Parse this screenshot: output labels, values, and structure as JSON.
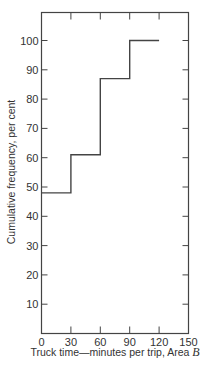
{
  "chart_data": {
    "type": "line",
    "subtype": "step",
    "title": "",
    "xlabel": "Truck time—minutes per trip, Area B",
    "xlabel_main": "Truck time—minutes per trip, Area ",
    "xlabel_italic": "B",
    "ylabel": "Cumulative frequency, per cent",
    "xlim": [
      0,
      150
    ],
    "ylim": [
      0,
      110
    ],
    "x_ticks": [
      0,
      30,
      60,
      90,
      120,
      150
    ],
    "y_ticks": [
      10,
      20,
      30,
      40,
      50,
      60,
      70,
      80,
      90,
      100
    ],
    "grid": false,
    "legend": null,
    "series": [
      {
        "name": "Cumulative frequency",
        "x": [
          0,
          30,
          30,
          60,
          60,
          90,
          90,
          120
        ],
        "y": [
          48,
          48,
          61,
          61,
          87,
          87,
          100,
          100
        ]
      }
    ],
    "steps": [
      {
        "x_from": 0,
        "x_to": 30,
        "value": 48
      },
      {
        "x_from": 30,
        "x_to": 60,
        "value": 61
      },
      {
        "x_from": 60,
        "x_to": 90,
        "value": 87
      },
      {
        "x_from": 90,
        "x_to": 120,
        "value": 100
      }
    ]
  }
}
